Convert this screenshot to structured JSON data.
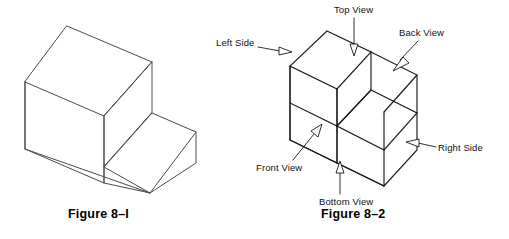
{
  "page": {
    "background_color": "#ffffff",
    "line_color": "#1a1a1a",
    "type": "technical-drawing"
  },
  "figures": [
    {
      "id": "figure-1",
      "caption": "Figure 8–I",
      "shape": "isometric step block",
      "labels": []
    },
    {
      "id": "figure-2",
      "caption": "Figure 8–2",
      "shape": "isometric step block",
      "labels": [
        {
          "key": "top",
          "text": "Top View",
          "arrow_direction": "down"
        },
        {
          "key": "back",
          "text": "Back View",
          "arrow_direction": "down-left"
        },
        {
          "key": "left",
          "text": "Left Side",
          "arrow_direction": "right"
        },
        {
          "key": "right",
          "text": "Right Side",
          "arrow_direction": "left"
        },
        {
          "key": "front",
          "text": "Front View",
          "arrow_direction": "up-right"
        },
        {
          "key": "bottom",
          "text": "Bottom View",
          "arrow_direction": "up"
        }
      ]
    }
  ]
}
